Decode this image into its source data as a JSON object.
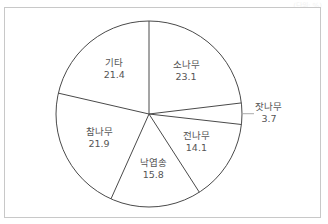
{
  "chart_data": {
    "type": "pie",
    "title": "",
    "unit_label": "(단위: %)",
    "start_angle_deg": 0,
    "direction": "clockwise",
    "categories": [
      "소나무",
      "잣나무",
      "전나무",
      "낙엽송",
      "참나무",
      "기타"
    ],
    "values": [
      23.1,
      3.7,
      14.1,
      15.8,
      21.9,
      21.4
    ],
    "slices": [
      {
        "label": "소나무",
        "value": 23.1,
        "value_text": "23.1"
      },
      {
        "label": "잣나무",
        "value": 3.7,
        "value_text": "3.7",
        "leader_line": true
      },
      {
        "label": "전나무",
        "value": 14.1,
        "value_text": "14.1"
      },
      {
        "label": "낙엽송",
        "value": 15.8,
        "value_text": "15.8"
      },
      {
        "label": "참나무",
        "value": 21.9,
        "value_text": "21.9"
      },
      {
        "label": "기타",
        "value": 21.4,
        "value_text": "21.4"
      }
    ],
    "colors": {
      "fill": "#ffffff",
      "stroke": "#4a4a4a",
      "text": "#555555",
      "frame": "#c8c8c8"
    },
    "legend": "none"
  }
}
